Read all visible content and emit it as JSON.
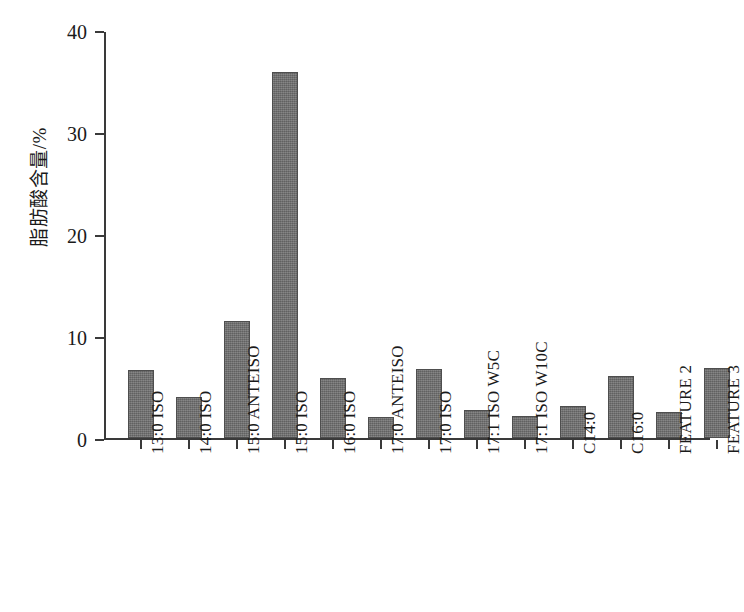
{
  "chart_data": {
    "type": "bar",
    "title": "",
    "subtitle": "",
    "xlabel": "",
    "ylabel": "脂肪酸含量/%",
    "ylim": [
      0,
      40
    ],
    "yticks": [
      0,
      10,
      20,
      30,
      40
    ],
    "ytick_labels": [
      "0",
      "10",
      "20",
      "30",
      "40"
    ],
    "grid": false,
    "legend": null,
    "bar_color": "#6c6c6c",
    "axis_color": "#3a3a3a",
    "categories": [
      "13:0 ISO",
      "14:0 ISO",
      "15:0 ANTEISO",
      "15:0 ISO",
      "16:0 ISO",
      "17:0 ANTEISO",
      "17:0 ISO",
      "17:1 ISO W5C",
      "17:1 ISO W10C",
      "C14:0",
      "C16:0",
      "FEATURE 2",
      "FEATURE 3"
    ],
    "values": [
      6.7,
      4.1,
      11.5,
      35.9,
      5.9,
      2.1,
      6.8,
      2.8,
      2.2,
      3.2,
      6.1,
      2.6,
      6.9
    ]
  }
}
